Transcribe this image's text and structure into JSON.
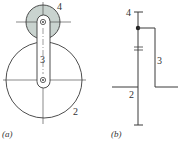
{
  "figure": {
    "panel_a": {
      "caption": "(a)",
      "labels": {
        "gear_sun": "2",
        "arm": "3",
        "gear_planet": "4"
      }
    },
    "panel_b": {
      "caption": "(b)",
      "labels": {
        "gear_sun": "2",
        "arm": "3",
        "gear_planet": "4"
      }
    }
  },
  "colors": {
    "stroke": "#3a3a3a",
    "planet_fill": "#c9d3cf",
    "background": "#ffffff"
  }
}
